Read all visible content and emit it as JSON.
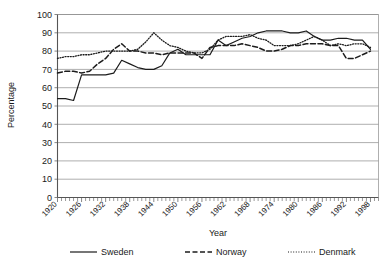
{
  "chart_data": {
    "type": "line",
    "title": "",
    "xlabel": "Year",
    "ylabel": "Percentage",
    "xlim": [
      1920,
      2000
    ],
    "ylim": [
      0,
      100
    ],
    "ytick_labels": [
      "100",
      "90",
      "80",
      "70",
      "60",
      "50",
      "40",
      "30",
      "20",
      "10",
      "0"
    ],
    "ytick_values": [
      100,
      90,
      80,
      70,
      60,
      50,
      40,
      30,
      20,
      10,
      0
    ],
    "xtick_labels": [
      "1920",
      "1926",
      "1932",
      "1938",
      "1944",
      "1950",
      "1956",
      "1962",
      "1968",
      "1974",
      "1980",
      "1986",
      "1992",
      "1998"
    ],
    "xtick_values": [
      1920,
      1926,
      1932,
      1938,
      1944,
      1950,
      1956,
      1962,
      1968,
      1974,
      1980,
      1986,
      1992,
      1998
    ],
    "minor_tick_step": 1,
    "grid": true,
    "legend_position": "bottom",
    "x": [
      1920,
      1922,
      1924,
      1926,
      1928,
      1930,
      1932,
      1934,
      1936,
      1938,
      1940,
      1942,
      1944,
      1946,
      1948,
      1950,
      1952,
      1954,
      1956,
      1958,
      1960,
      1962,
      1964,
      1966,
      1968,
      1970,
      1972,
      1974,
      1976,
      1978,
      1980,
      1982,
      1984,
      1986,
      1988,
      1990,
      1992,
      1994,
      1996,
      1998
    ],
    "series": [
      {
        "name": "Sweden",
        "style": "solid",
        "color": "#1c1c1c",
        "values": [
          54,
          54,
          53,
          67,
          67,
          67,
          67,
          68,
          75,
          73,
          71,
          70,
          70,
          72,
          79,
          81,
          78,
          78,
          78,
          78,
          86,
          83,
          85,
          87,
          88,
          90,
          91,
          91,
          91,
          90,
          90,
          91,
          88,
          86,
          86,
          87,
          87,
          86,
          86,
          81
        ]
      },
      {
        "name": "Norway",
        "style": "dashed",
        "color": "#1c1c1c",
        "values": [
          68,
          69,
          69,
          68,
          69,
          73,
          76,
          81,
          84,
          80,
          80,
          79,
          79,
          78,
          79,
          79,
          79,
          79,
          76,
          82,
          83,
          83,
          83,
          84,
          83,
          82,
          80,
          80,
          81,
          83,
          83,
          84,
          84,
          84,
          83,
          83,
          76,
          76,
          78,
          80
        ]
      },
      {
        "name": "Denmark",
        "style": "dotted",
        "color": "#666666",
        "values": [
          76,
          77,
          77,
          78,
          78,
          79,
          80,
          80,
          80,
          80,
          81,
          85,
          90,
          86,
          83,
          82,
          80,
          79,
          79,
          81,
          86,
          88,
          88,
          88,
          89,
          87,
          86,
          83,
          83,
          83,
          84,
          86,
          88,
          86,
          83,
          84,
          83,
          84,
          84,
          82
        ]
      }
    ]
  },
  "legend": {
    "items": [
      {
        "label": "Sweden",
        "style": "solid"
      },
      {
        "label": "Norway",
        "style": "dashed"
      },
      {
        "label": "Denmark",
        "style": "dotted"
      }
    ]
  }
}
